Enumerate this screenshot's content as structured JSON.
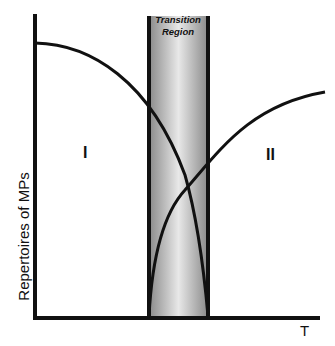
{
  "figure": {
    "y_axis_label": "Repertoires of MPs",
    "x_axis_label": "T",
    "region_left_label": "I",
    "region_right_label": "II",
    "transition_label_line1": "Transition",
    "transition_label_line2": "Region"
  },
  "colors": {
    "axis": "#111111",
    "curve": "#111111",
    "transition_band_edge": "#8c8c8c",
    "transition_band_center": "#e6e6e6",
    "background": "#ffffff"
  }
}
